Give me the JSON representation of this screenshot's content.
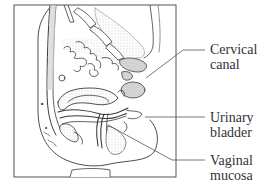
{
  "figure": {
    "line_color": "#3a3a3a",
    "stipple_color": "#c8c8c8",
    "frame_color": "#555555"
  },
  "labels": [
    {
      "id": "cervical-canal",
      "lines": [
        "Cervical",
        "canal"
      ]
    },
    {
      "id": "urinary-bladder",
      "lines": [
        "Urinary",
        "bladder"
      ]
    },
    {
      "id": "vaginal-mucosa",
      "lines": [
        "Vaginal",
        "mucosa"
      ]
    }
  ]
}
